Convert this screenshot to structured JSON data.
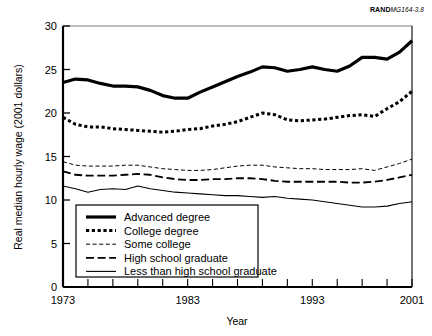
{
  "figure": {
    "source_id_brand": "RAND",
    "source_id_number": "MG164-3.8"
  },
  "chart_data": {
    "type": "line",
    "title": "",
    "xlabel": "Year",
    "ylabel": "Real median hourly wage (2001 dollars)",
    "xlim": [
      1973,
      2001
    ],
    "ylim": [
      0,
      30
    ],
    "yticks": [
      0,
      5,
      10,
      15,
      20,
      25,
      30
    ],
    "ytick_labels": [
      "0",
      "5",
      "10",
      "15",
      "20",
      "25",
      "30"
    ],
    "xticks": [
      1973,
      1975,
      1977,
      1979,
      1981,
      1983,
      1985,
      1987,
      1989,
      1991,
      1993,
      1995,
      1997,
      1999,
      2001
    ],
    "xtick_labels_shown": [
      "1973",
      "1983",
      "1993",
      "2001"
    ],
    "xtick_labels_shown_at": [
      1973,
      1983,
      1993,
      2001
    ],
    "grid": false,
    "legend_position": "lower-left-inside",
    "x": [
      1973,
      1974,
      1975,
      1976,
      1977,
      1978,
      1979,
      1980,
      1981,
      1982,
      1983,
      1984,
      1985,
      1986,
      1987,
      1988,
      1989,
      1990,
      1991,
      1992,
      1993,
      1994,
      1995,
      1996,
      1997,
      1998,
      1999,
      2000,
      2001
    ],
    "series": [
      {
        "name": "Advanced degree",
        "style": "solid-thick",
        "values": [
          23.5,
          23.9,
          23.8,
          23.4,
          23.1,
          23.1,
          23.0,
          22.6,
          22.0,
          21.7,
          21.7,
          22.4,
          23.0,
          23.6,
          24.2,
          24.7,
          25.3,
          25.2,
          24.8,
          25.0,
          25.3,
          25.0,
          24.8,
          25.4,
          26.4,
          26.4,
          26.2,
          27.0,
          28.3
        ]
      },
      {
        "name": "College degree",
        "style": "dotted-thick",
        "values": [
          19.5,
          18.7,
          18.4,
          18.4,
          18.2,
          18.1,
          18.0,
          17.9,
          17.8,
          17.9,
          18.1,
          18.2,
          18.5,
          18.7,
          19.0,
          19.5,
          20.0,
          19.8,
          19.2,
          19.1,
          19.2,
          19.3,
          19.5,
          19.7,
          19.8,
          19.6,
          20.5,
          21.3,
          22.5
        ]
      },
      {
        "name": "Some college",
        "style": "dashed-fine",
        "values": [
          14.4,
          14.0,
          13.9,
          13.9,
          13.9,
          14.0,
          14.0,
          13.8,
          13.6,
          13.5,
          13.4,
          13.4,
          13.5,
          13.7,
          13.9,
          14.0,
          14.0,
          13.8,
          13.7,
          13.6,
          13.6,
          13.5,
          13.5,
          13.5,
          13.6,
          13.4,
          13.8,
          14.2,
          14.7
        ]
      },
      {
        "name": "High school graduate",
        "style": "dashed-long",
        "values": [
          13.3,
          12.9,
          12.8,
          12.8,
          12.8,
          12.9,
          13.0,
          12.9,
          12.6,
          12.4,
          12.3,
          12.3,
          12.4,
          12.4,
          12.5,
          12.5,
          12.4,
          12.2,
          12.1,
          12.1,
          12.1,
          12.1,
          12.1,
          12.0,
          12.0,
          12.1,
          12.3,
          12.6,
          12.9
        ]
      },
      {
        "name": "Less than high school graduate",
        "style": "solid-thin",
        "values": [
          11.6,
          11.3,
          10.9,
          11.2,
          11.3,
          11.2,
          11.6,
          11.3,
          11.1,
          10.9,
          10.8,
          10.7,
          10.6,
          10.5,
          10.5,
          10.4,
          10.3,
          10.4,
          10.2,
          10.1,
          10.0,
          9.8,
          9.6,
          9.4,
          9.2,
          9.2,
          9.3,
          9.6,
          9.8
        ]
      }
    ]
  }
}
